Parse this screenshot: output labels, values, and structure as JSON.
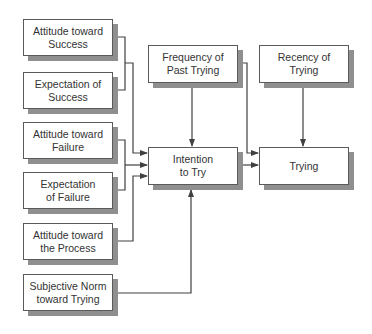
{
  "diagram": {
    "type": "flow",
    "colors": {
      "box_border": "#5a5a5a",
      "box_shadow": "#8f8f8f",
      "line": "#404040",
      "text": "#333333",
      "background": "#ffffff"
    },
    "nodes": {
      "attitude_success": {
        "line1": "Attitude toward",
        "line2": "Success"
      },
      "expectation_success": {
        "line1": "Expectation of",
        "line2": "Success"
      },
      "attitude_failure": {
        "line1": "Attitude toward",
        "line2": "Failure"
      },
      "expectation_failure": {
        "line1": "Expectation",
        "line2": "of Failure"
      },
      "attitude_process": {
        "line1": "Attitude toward",
        "line2": "the Process"
      },
      "subjective_norm": {
        "line1": "Subjective Norm",
        "line2": "toward Trying"
      },
      "frequency_past": {
        "line1": "Frequency of",
        "line2": "Past Trying"
      },
      "recency": {
        "line1": "Recency of",
        "line2": "Trying"
      },
      "intention": {
        "line1": "Intention",
        "line2": "to Try"
      },
      "trying": {
        "line1": "Trying"
      }
    },
    "edges": [
      {
        "from": "attitude_success + expectation_success",
        "to": "intention"
      },
      {
        "from": "attitude_failure + expectation_failure",
        "to": "intention"
      },
      {
        "from": "attitude_process",
        "to": "intention"
      },
      {
        "from": "subjective_norm",
        "to": "intention"
      },
      {
        "from": "frequency_past",
        "to": "intention"
      },
      {
        "from": "frequency_past",
        "to": "trying"
      },
      {
        "from": "intention",
        "to": "trying"
      },
      {
        "from": "recency",
        "to": "trying"
      }
    ]
  }
}
